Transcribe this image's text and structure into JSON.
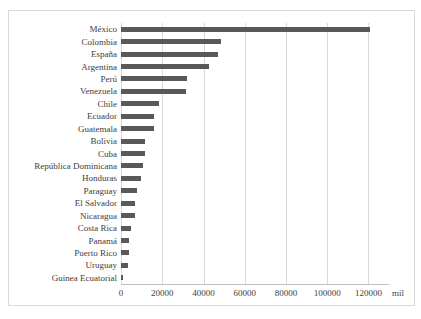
{
  "chart_data": {
    "type": "bar",
    "orientation": "horizontal",
    "title": "",
    "categories": [
      "México",
      "Colombia",
      "España",
      "Argentina",
      "Perú",
      "Venezuela",
      "Chile",
      "Ecuador",
      "Guatemala",
      "Bolivia",
      "Cuba",
      "República Dominicana",
      "Honduras",
      "Paraguay",
      "El Salvador",
      "Nicaragua",
      "Costa Rica",
      "Panamá",
      "Puerto Rico",
      "Uruguay",
      "Guinea Ecuatorial"
    ],
    "values": [
      121000,
      48500,
      47200,
      42500,
      32000,
      31500,
      18500,
      16000,
      15800,
      11700,
      11500,
      10500,
      9500,
      7800,
      6900,
      6600,
      5000,
      3900,
      3700,
      3600,
      900
    ],
    "xlabel": "",
    "ylabel": "",
    "unit_label": "mil",
    "xlim": [
      0,
      130000
    ],
    "xticks": [
      0,
      20000,
      40000,
      60000,
      80000,
      100000,
      120000
    ],
    "xtick_labels": [
      "0",
      "20000",
      "40000",
      "60000",
      "80000",
      "100000",
      "120000"
    ],
    "grid": true,
    "legend": "none",
    "colors": {
      "bar": "#595959",
      "gridline": "#d9d9d9",
      "axis_line": "#bfbfbf",
      "text": "#404040",
      "frame_border": "#d9d9d9",
      "background": "#ffffff"
    }
  }
}
